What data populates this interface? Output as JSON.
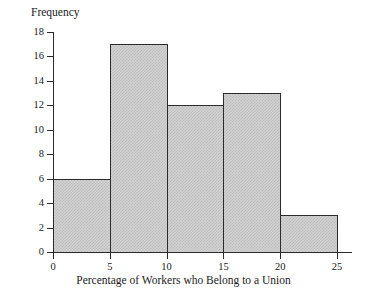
{
  "chart_data": {
    "type": "bar",
    "title": "",
    "xlabel": "Percentage of Workers who Belong to a Union",
    "ylabel": "Frequency",
    "bin_width": 5,
    "bin_edges": [
      0,
      5,
      10,
      15,
      20,
      25
    ],
    "categories": [
      "0-5",
      "5-10",
      "10-15",
      "15-20",
      "20-25"
    ],
    "values": [
      6,
      17,
      12,
      13,
      3
    ],
    "xlim": [
      0,
      25
    ],
    "ylim": [
      0,
      18
    ],
    "xticks": [
      "0",
      "5",
      "10",
      "15",
      "20",
      "25"
    ],
    "xtick_values": [
      0,
      5,
      10,
      15,
      20,
      25
    ],
    "yticks": [
      "0",
      "2",
      "4",
      "6",
      "8",
      "10",
      "12",
      "14",
      "16",
      "18"
    ],
    "ytick_values": [
      0,
      2,
      4,
      6,
      8,
      10,
      12,
      14,
      16,
      18
    ],
    "grid": false,
    "legend": null,
    "bar_fill_color": "#d2d2d2",
    "bar_edge_color": "#2b2b2b",
    "axis_color": "#2b2b2b",
    "background_color": "#ffffff"
  }
}
